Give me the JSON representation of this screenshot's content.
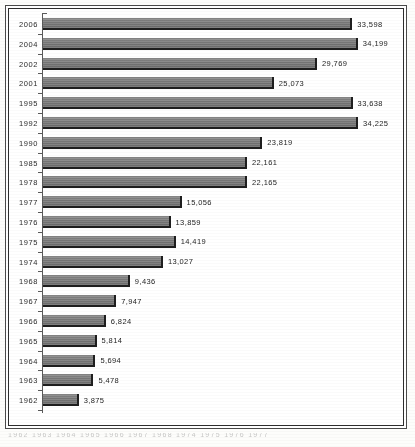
{
  "chart_data": {
    "type": "bar",
    "orientation": "horizontal",
    "title": "",
    "xlabel": "",
    "ylabel": "",
    "grid": false,
    "legend": null,
    "xlim": [
      0,
      34225
    ],
    "categories": [
      "2006",
      "2004",
      "2002",
      "2001",
      "1995",
      "1992",
      "1990",
      "1985",
      "1978",
      "1977",
      "1976",
      "1975",
      "1974",
      "1968",
      "1967",
      "1966",
      "1965",
      "1964",
      "1963",
      "1962"
    ],
    "values": [
      33598,
      34199,
      29769,
      25073,
      33638,
      34225,
      23819,
      22161,
      22165,
      15056,
      13859,
      14419,
      13027,
      9436,
      7947,
      6824,
      5814,
      5694,
      5478,
      3875
    ],
    "value_labels": [
      "33,598",
      "34,199",
      "29,769",
      "25,073",
      "33,638",
      "34,225",
      "23,819",
      "22,161",
      "22,165",
      "15,056",
      "13,859",
      "14,419",
      "13,027",
      "9,436",
      "7,947",
      "6,824",
      "5,814",
      "5,694",
      "5,478",
      "3,875"
    ],
    "rows": [
      {
        "category": "2006",
        "value": 33598,
        "label": "33,598"
      },
      {
        "category": "2004",
        "value": 34199,
        "label": "34,199"
      },
      {
        "category": "2002",
        "value": 29769,
        "label": "29,769"
      },
      {
        "category": "2001",
        "value": 25073,
        "label": "25,073"
      },
      {
        "category": "1995",
        "value": 33638,
        "label": "33,638"
      },
      {
        "category": "1992",
        "value": 34225,
        "label": "34,225"
      },
      {
        "category": "1990",
        "value": 23819,
        "label": "23,819"
      },
      {
        "category": "1985",
        "value": 22161,
        "label": "22,161"
      },
      {
        "category": "1978",
        "value": 22165,
        "label": "22,165"
      },
      {
        "category": "1977",
        "value": 15056,
        "label": "15,056"
      },
      {
        "category": "1976",
        "value": 13859,
        "label": "13,859"
      },
      {
        "category": "1975",
        "value": 14419,
        "label": "14,419"
      },
      {
        "category": "1974",
        "value": 13027,
        "label": "13,027"
      },
      {
        "category": "1968",
        "value": 9436,
        "label": "9,436"
      },
      {
        "category": "1967",
        "value": 7947,
        "label": "7,947"
      },
      {
        "category": "1966",
        "value": 6824,
        "label": "6,824"
      },
      {
        "category": "1965",
        "value": 5814,
        "label": "5,814"
      },
      {
        "category": "1964",
        "value": 5694,
        "label": "5,694"
      },
      {
        "category": "1963",
        "value": 5478,
        "label": "5,478"
      },
      {
        "category": "1962",
        "value": 3875,
        "label": "3,875"
      }
    ],
    "colors": {
      "bar_fill": "#7b7b7b",
      "bar_shadow": "#1e1e1e",
      "axis": "#5a5a5a",
      "text": "#2b2b2b",
      "background": "#ffffff",
      "frame": "#2e2e2e"
    }
  },
  "caption": {
    "text": "1962 1963 1964 1965 1966 1967 1968 1974 1975 1976 1977"
  }
}
